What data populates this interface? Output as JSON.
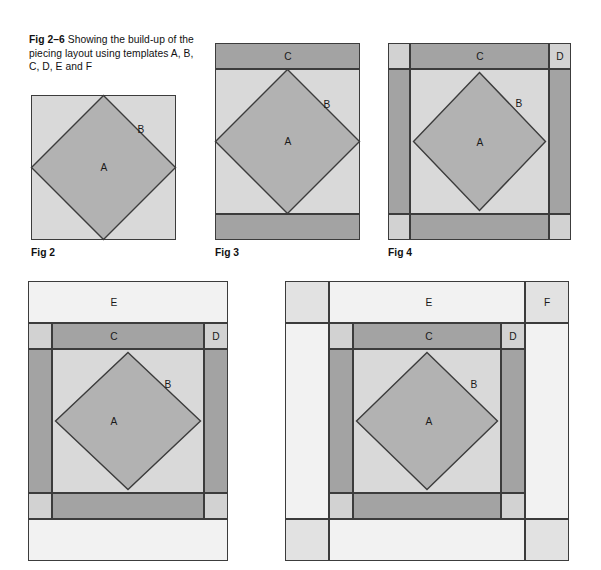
{
  "caption": {
    "lead": "Fig 2–6",
    "text": " Showing the build-up of the piecing layout using templates A, B, C, D, E and F"
  },
  "colors": {
    "A": "#b2b2b2",
    "B": "#d9d9d9",
    "C": "#a3a3a3",
    "D": "#d2d2d2",
    "E": "#f2f2f2",
    "F": "#e2e2e2",
    "outline": "#3c3c3c",
    "background": "#ffffff"
  },
  "labels": {
    "A": "A",
    "B": "B",
    "C": "C",
    "D": "D",
    "E": "E",
    "F": "F"
  },
  "figures": [
    {
      "id": "fig2",
      "label": "Fig 2",
      "pieces": [
        "A",
        "B"
      ],
      "description": "Square of template B with on-point square A centered"
    },
    {
      "id": "fig3",
      "label": "Fig 3",
      "pieces": [
        "A",
        "B",
        "C"
      ],
      "description": "Fig 2 with C strips added top and bottom"
    },
    {
      "id": "fig4",
      "label": "Fig 4",
      "pieces": [
        "A",
        "B",
        "C",
        "D"
      ],
      "description": "Fig 3 with C strips at sides and D corner squares"
    },
    {
      "id": "fig5",
      "label": "",
      "pieces": [
        "A",
        "B",
        "C",
        "D",
        "E"
      ],
      "description": "Fig 4 with E bands added top and bottom"
    },
    {
      "id": "fig6",
      "label": "",
      "pieces": [
        "A",
        "B",
        "C",
        "D",
        "E",
        "F"
      ],
      "description": "Fig 5 with E bands at sides and F corner squares"
    }
  ]
}
